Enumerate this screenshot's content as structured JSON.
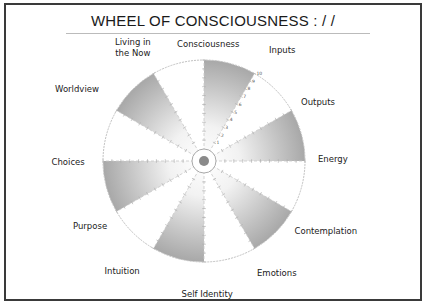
{
  "title": "WHEEL OF CONSCIOUSNESS :    /    /",
  "wheel": {
    "center": [
      204,
      161
    ],
    "outer_radius": 101,
    "inner_radius": 12,
    "hub_radius": 5,
    "segment_count": 12,
    "scale_max": 10,
    "scale_labels": [
      "1",
      "2",
      "3",
      "4",
      "5",
      "6",
      "7",
      "8",
      "9",
      "10"
    ],
    "shaded_segments": [
      0,
      2,
      4,
      6,
      8,
      10
    ],
    "shade_color": "#a8a8a8",
    "line_color": "#c8c8c8"
  },
  "labels": [
    {
      "text": "Consciousness",
      "x": 208,
      "y": 44
    },
    {
      "text": "Inputs",
      "x": 282,
      "y": 50
    },
    {
      "text": "Outputs",
      "x": 318,
      "y": 102
    },
    {
      "text": "Energy",
      "x": 333,
      "y": 159
    },
    {
      "text": "Contemplation",
      "x": 326,
      "y": 231
    },
    {
      "text": "Emotions",
      "x": 277,
      "y": 273
    },
    {
      "text": "Self Identity",
      "x": 207,
      "y": 294
    },
    {
      "text": "Intuition",
      "x": 122,
      "y": 271
    },
    {
      "text": "Purpose",
      "x": 90,
      "y": 226
    },
    {
      "text": "Choices",
      "x": 68,
      "y": 162
    },
    {
      "text": "Worldview",
      "x": 77,
      "y": 89
    },
    {
      "text": "Living in\nthe Now",
      "x": 133,
      "y": 48
    }
  ]
}
